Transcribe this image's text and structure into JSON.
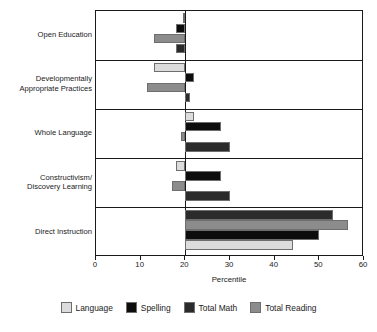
{
  "chart_data": {
    "type": "bar",
    "orientation": "horizontal",
    "title": "",
    "xlabel": "Percentile",
    "ylabel": "",
    "xlim": [
      0,
      60
    ],
    "xticks": [
      0,
      10,
      20,
      30,
      40,
      50,
      60
    ],
    "baseline": 20,
    "grid": false,
    "legend_position": "bottom",
    "categories": [
      "Open Education",
      "Developmentally Appropriate Practices",
      "Whole Language",
      "Constructivism/ Discovery Learning",
      "Direct Instruction"
    ],
    "series": [
      {
        "name": "Language",
        "color": "#dcdcdc",
        "values": [
          19.5,
          13.0,
          22.0,
          18.0,
          44.0
        ]
      },
      {
        "name": "Spelling",
        "color": "#0d0d0d",
        "values": [
          18.0,
          22.0,
          28.0,
          28.0,
          50.0
        ]
      },
      {
        "name": "Total Math",
        "color": "#2b2b2b",
        "values": [
          18.0,
          21.0,
          30.0,
          30.0,
          53.0
        ]
      },
      {
        "name": "Total Reading",
        "color": "#8c8c8c",
        "values": [
          13.0,
          11.5,
          19.0,
          17.0,
          56.5
        ]
      }
    ],
    "series_draw_order": [
      [
        "Language",
        "Spelling",
        "Total Reading",
        "Total Math"
      ],
      [
        "Language",
        "Spelling",
        "Total Reading",
        "Total Math"
      ],
      [
        "Language",
        "Spelling",
        "Total Reading",
        "Total Math"
      ],
      [
        "Language",
        "Spelling",
        "Total Reading",
        "Total Math"
      ],
      [
        "Total Math",
        "Total Reading",
        "Spelling",
        "Language"
      ]
    ]
  },
  "axis": {
    "xlabel": "Percentile",
    "tick_labels": [
      "0",
      "10",
      "20",
      "30",
      "40",
      "50",
      "60"
    ]
  },
  "categories": [
    {
      "line1": "Open Education",
      "line2": ""
    },
    {
      "line1": "Developmentally",
      "line2": "Appropriate Practices"
    },
    {
      "line1": "Whole Language",
      "line2": ""
    },
    {
      "line1": "Constructivism/",
      "line2": "Discovery Learning"
    },
    {
      "line1": "Direct Instruction",
      "line2": ""
    }
  ],
  "legend": {
    "items": [
      {
        "label": "Language",
        "color": "#dcdcdc"
      },
      {
        "label": "Spelling",
        "color": "#0d0d0d"
      },
      {
        "label": "Total Math",
        "color": "#2b2b2b"
      },
      {
        "label": "Total Reading",
        "color": "#8c8c8c"
      }
    ]
  },
  "colors": {
    "axis": "#1a1a1a",
    "background": "#ffffff",
    "bar_stroke": "#6e6e6e"
  }
}
